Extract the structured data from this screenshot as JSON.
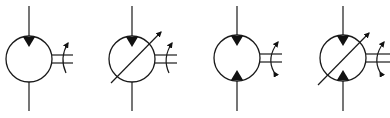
{
  "diagram": {
    "type": "hydraulic-symbols",
    "colors": {
      "line": "#1a1a1a",
      "fill": "#111111",
      "background": "#ffffff"
    },
    "symbols": [
      {
        "id": "symbol-1",
        "kind": "fixed-displacement-unidirectional",
        "center": [
          29,
          59
        ],
        "radius": 23,
        "triangles": [
          "top-pointing-in"
        ],
        "variable_arrow": false,
        "rotation": "single-direction"
      },
      {
        "id": "symbol-2",
        "kind": "variable-displacement-unidirectional",
        "center": [
          132,
          59
        ],
        "radius": 23,
        "triangles": [
          "top-pointing-in"
        ],
        "variable_arrow": true,
        "rotation": "single-direction"
      },
      {
        "id": "symbol-3",
        "kind": "fixed-displacement-bidirectional",
        "center": [
          237,
          58
        ],
        "radius": 23,
        "triangles": [
          "top-pointing-in",
          "bottom-pointing-in"
        ],
        "variable_arrow": false,
        "rotation": "bi-direction"
      },
      {
        "id": "symbol-4",
        "kind": "variable-displacement-bidirectional",
        "center": [
          343,
          58
        ],
        "radius": 23,
        "triangles": [
          "top-pointing-in",
          "bottom-pointing-in"
        ],
        "variable_arrow": true,
        "rotation": "bi-direction"
      }
    ]
  }
}
